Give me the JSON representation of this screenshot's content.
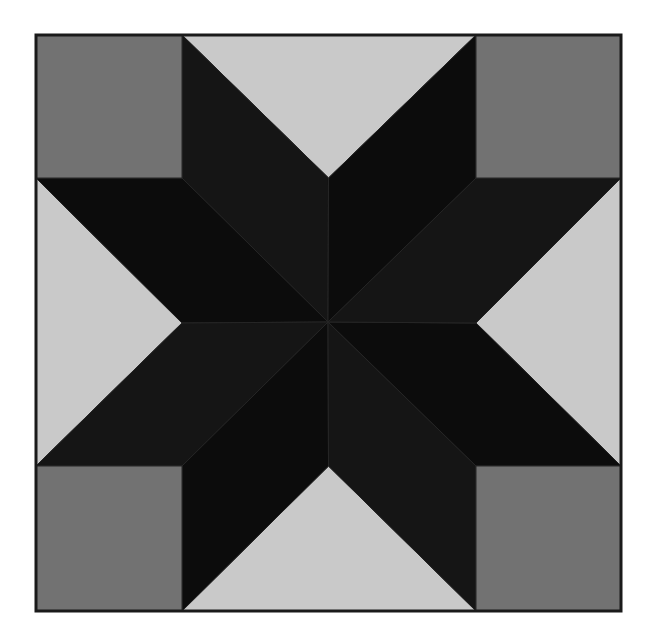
{
  "image": {
    "subject": "LeMoyne star quilt block",
    "colors": {
      "background": "#ffffff",
      "border": "#1a1a1a",
      "corner_squares": "#727272",
      "side_triangles": "#c9c9c9",
      "star_diamonds_a": "#0c0c0c",
      "star_diamonds_b": "#151515",
      "seam_lines": "#262626"
    },
    "geometry": {
      "block": {
        "x1": 36,
        "y1": 35,
        "x2": 621,
        "y2": 611
      },
      "center": {
        "x": 328,
        "y": 322
      },
      "inner": {
        "x1": 182,
        "y1": 178,
        "x2": 476,
        "y2": 466
      }
    },
    "pieces": {
      "corner_squares": 4,
      "side_triangles": 4,
      "star_diamonds": 8
    }
  }
}
